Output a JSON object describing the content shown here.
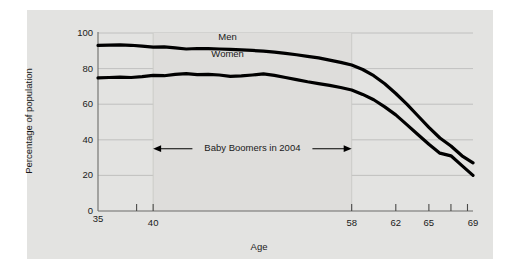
{
  "chart_data": {
    "type": "line",
    "title": "",
    "xlabel": "Age",
    "ylabel": "Percentage of population",
    "xlim": [
      35,
      69
    ],
    "ylim": [
      0,
      100
    ],
    "grid": true,
    "legend_position": "inline-labels",
    "y_ticks": [
      0,
      20,
      40,
      60,
      80,
      100
    ],
    "y_tick_labels": [
      "0",
      "20",
      "40",
      "60",
      "80",
      "100"
    ],
    "x_ticks": [
      35,
      38.5,
      40,
      58,
      62,
      65,
      67,
      68.5,
      69
    ],
    "x_tick_labels": [
      "35",
      "",
      "40",
      "58",
      "62",
      "65",
      "",
      "",
      "69"
    ],
    "x_labeled_ticks": [
      {
        "value": 35,
        "label": "35"
      },
      {
        "value": 40,
        "label": "40"
      },
      {
        "value": 58,
        "label": "58"
      },
      {
        "value": 62,
        "label": "62"
      },
      {
        "value": 65,
        "label": "65"
      },
      {
        "value": 69,
        "label": "69"
      }
    ],
    "x_minor_ticks": [
      38.5,
      40,
      58,
      62,
      65,
      67,
      68.5
    ],
    "annotations": [
      {
        "text": "Baby Boomers in 2004",
        "type": "double-arrow-span",
        "x_start": 40,
        "x_end": 58,
        "y": 35
      }
    ],
    "shaded_band": {
      "x_start": 40,
      "x_end": 58,
      "label": "Baby Boomers in 2004"
    },
    "series": [
      {
        "name": "Men",
        "color": "#000000",
        "x": [
          35,
          36,
          37,
          38,
          39,
          40,
          41,
          42,
          43,
          44,
          45,
          46,
          47,
          48,
          49,
          50,
          51,
          52,
          53,
          54,
          55,
          56,
          57,
          58,
          59,
          60,
          61,
          62,
          63,
          64,
          65,
          66,
          67,
          68,
          69
        ],
        "values": [
          93,
          93.2,
          93.3,
          93.1,
          92.6,
          92.1,
          92.2,
          91.6,
          91.0,
          91.3,
          91.2,
          91.0,
          90.8,
          90.5,
          90.2,
          89.8,
          89.3,
          88.6,
          87.8,
          86.9,
          86.0,
          84.8,
          83.5,
          82.0,
          79.5,
          76.0,
          71.5,
          66.0,
          60.0,
          53.5,
          47.0,
          41.0,
          36.5,
          31.0,
          27.0
        ]
      },
      {
        "name": "Women",
        "color": "#000000",
        "x": [
          35,
          36,
          37,
          38,
          39,
          40,
          41,
          42,
          43,
          44,
          45,
          46,
          47,
          48,
          49,
          50,
          51,
          52,
          53,
          54,
          55,
          56,
          57,
          58,
          59,
          60,
          61,
          62,
          63,
          64,
          65,
          66,
          67,
          68,
          69
        ],
        "values": [
          74.8,
          75.0,
          75.2,
          75.0,
          75.5,
          76.2,
          76.0,
          76.8,
          77.2,
          76.6,
          76.8,
          76.4,
          75.6,
          75.9,
          76.4,
          77.0,
          76.2,
          75.0,
          73.8,
          72.6,
          71.6,
          70.6,
          69.4,
          68.0,
          65.5,
          62.5,
          58.5,
          54.0,
          48.5,
          43.0,
          37.5,
          32.5,
          31.0,
          25.5,
          20.0
        ]
      }
    ]
  },
  "series_labels": [
    {
      "name": "Men",
      "text": "Men"
    },
    {
      "name": "Women",
      "text": "Women"
    }
  ],
  "annotation": {
    "text": "Baby Boomers in 2004"
  },
  "axes": {
    "x_title": "Age",
    "y_title": "Percentage of population"
  },
  "colors": {
    "panel_background": "#e3e3e1",
    "figure_background": "#ffffff",
    "line": "#000000",
    "gridline": "#b8b8b6",
    "axis": "#5a5a5a",
    "text": "#1a1a1a"
  }
}
